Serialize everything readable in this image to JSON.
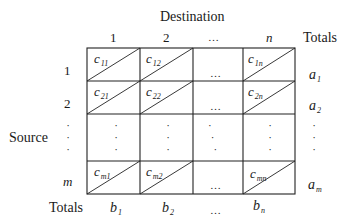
{
  "title": "Destination",
  "column_headers": [
    "1",
    "2",
    "…",
    "n"
  ],
  "totals_header": "Totals",
  "row_axis_label": "Source",
  "row_headers": [
    "1",
    "2",
    "⋮",
    "m"
  ],
  "totals_row_label": "Totals",
  "cells": [
    [
      {
        "sym": "c",
        "sub": "11"
      },
      {
        "sym": "c",
        "sub": "12"
      },
      {
        "sym": "…",
        "sub": ""
      },
      {
        "sym": "c",
        "sub": "1n"
      }
    ],
    [
      {
        "sym": "c",
        "sub": "21"
      },
      {
        "sym": "c",
        "sub": "22"
      },
      {
        "sym": "…",
        "sub": ""
      },
      {
        "sym": "c",
        "sub": "2n"
      }
    ],
    [
      {
        "sym": "⋮",
        "sub": ""
      },
      {
        "sym": "⋮",
        "sub": ""
      },
      {
        "sym": "⋱",
        "sub": ""
      },
      {
        "sym": "⋮",
        "sub": ""
      }
    ],
    [
      {
        "sym": "c",
        "sub": "m1"
      },
      {
        "sym": "c",
        "sub": "m2"
      },
      {
        "sym": "…",
        "sub": ""
      },
      {
        "sym": "c",
        "sub": "mn"
      }
    ]
  ],
  "row_totals": [
    {
      "sym": "a",
      "sub": "1"
    },
    {
      "sym": "a",
      "sub": "2"
    },
    {
      "sym": "⋮",
      "sub": ""
    },
    {
      "sym": "a",
      "sub": "m"
    }
  ],
  "col_totals": [
    {
      "sym": "b",
      "sub": "1"
    },
    {
      "sym": "b",
      "sub": "2"
    },
    {
      "sym": "…",
      "sub": ""
    },
    {
      "sym": "b",
      "sub": "n"
    }
  ]
}
